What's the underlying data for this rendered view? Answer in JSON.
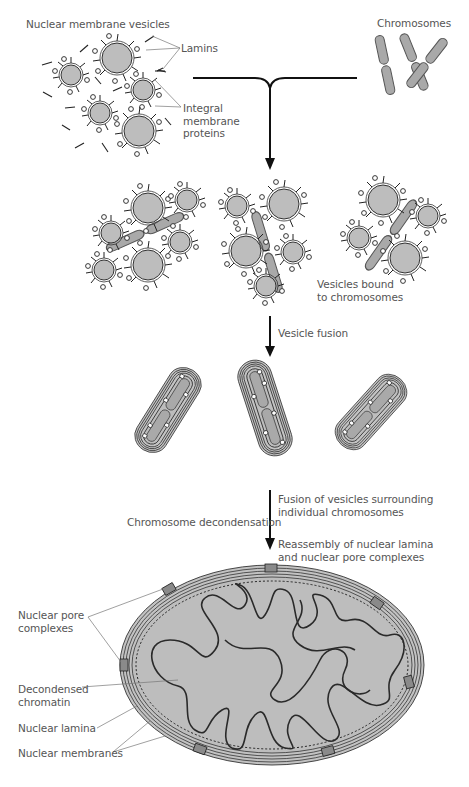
{
  "diagram": {
    "topic": "Reassembly of the nuclear envelope at the end of mitosis",
    "stages": [
      {
        "id": "start",
        "labels": [
          "Nuclear membrane vesicles",
          "Chromosomes"
        ]
      },
      {
        "id": "bound",
        "label": "Vesicles bound to chromosomes"
      },
      {
        "id": "fused",
        "step_label": "Vesicle fusion"
      },
      {
        "id": "nucleus",
        "step_labels": [
          "Fusion of vesicles surrounding individual chromosomes",
          "Reassembly of nuclear lamina and nuclear pore complexes",
          "Chromosome decondensation"
        ]
      }
    ]
  },
  "labels": {
    "nuclear_membrane_vesicles": "Nuclear membrane vesicles",
    "lamins": "Lamins",
    "integral_membrane_proteins": "Integral\nmembrane\nproteins",
    "chromosomes": "Chromosomes",
    "vesicles_bound": "Vesicles bound\nto chromosomes",
    "vesicle_fusion": "Vesicle fusion",
    "fusion_surrounding": "Fusion of vesicles surrounding\nindividual chromosomes",
    "chromosome_decondensation": "Chromosome decondensation",
    "reassembly": "Reassembly of nuclear lamina\nand nuclear pore complexes",
    "nuclear_pore_complexes": "Nuclear pore\ncomplexes",
    "decondensed_chromatin": "Decondensed\nchromatin",
    "nuclear_lamina": "Nuclear lamina",
    "nuclear_membranes": "Nuclear membranes"
  },
  "colors": {
    "fill_gray": "#b8b8b8",
    "chromosome_gray": "#a9a9a9",
    "stroke": "#222222",
    "label_text": "#555555",
    "leader_line": "#777777"
  }
}
